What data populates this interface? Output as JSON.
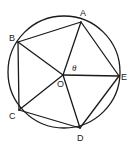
{
  "diagram": {
    "type": "inscribed-pentagon",
    "circle": {
      "cx": 64,
      "cy": 72,
      "r": 56
    },
    "center": {
      "name": "O",
      "x": 63,
      "y": 75,
      "label": "O",
      "label_x": 57,
      "label_y": 87
    },
    "vertices": [
      {
        "name": "A",
        "x": 81,
        "y": 22,
        "label": "A",
        "label_x": 80,
        "label_y": 16
      },
      {
        "name": "B",
        "x": 18,
        "y": 42,
        "label": "B",
        "label_x": 9,
        "label_y": 41
      },
      {
        "name": "C",
        "x": 19,
        "y": 110,
        "label": "C",
        "label_x": 9,
        "label_y": 119
      },
      {
        "name": "D",
        "x": 80,
        "y": 128,
        "label": "D",
        "label_x": 77,
        "label_y": 141
      },
      {
        "name": "E",
        "x": 119,
        "y": 76,
        "label": "E",
        "label_x": 121,
        "label_y": 80
      }
    ],
    "angle_label": {
      "text": "θ",
      "x": 72,
      "y": 71,
      "between": [
        "OA",
        "OE"
      ]
    },
    "edges": [
      "AB",
      "BC",
      "CD",
      "DE",
      "EA"
    ],
    "radii": [
      "OA",
      "OB",
      "OC",
      "OD",
      "OE"
    ],
    "stroke_color": "#1a1a1a",
    "background": "#ffffff"
  }
}
